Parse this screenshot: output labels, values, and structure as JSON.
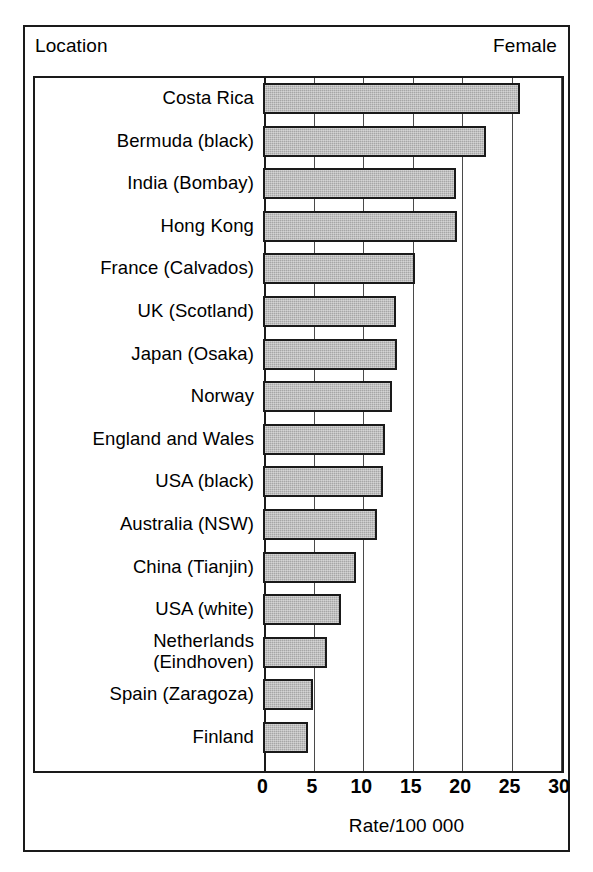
{
  "header": {
    "left_label": "Location",
    "right_label": "Female"
  },
  "axis": {
    "title": "Rate/100 000",
    "ticks": [
      "0",
      "5",
      "10",
      "15",
      "20",
      "25",
      "30"
    ]
  },
  "colors": {
    "bar_fill": "#a6a6a6",
    "bar_stroke": "#1a1a1a",
    "frame": "#1a1a1a",
    "gridline": "#4a4a4a",
    "background": "#ffffff"
  },
  "chart_data": {
    "type": "bar",
    "orientation": "horizontal",
    "title": "",
    "subtitle": "",
    "xlabel": "Rate/100 000",
    "ylabel": "Location",
    "legend": "Female",
    "legend_position": "top-right",
    "grid": true,
    "xlim": [
      0,
      30
    ],
    "xticks": [
      0,
      5,
      10,
      15,
      20,
      25,
      30
    ],
    "categories": [
      "Costa Rica",
      "Bermuda (black)",
      "India (Bombay)",
      "Hong Kong",
      "France (Calvados)",
      "UK (Scotland)",
      "Japan (Osaka)",
      "Norway",
      "England and Wales",
      "USA (black)",
      "Australia (NSW)",
      "China (Tianjin)",
      "USA (white)",
      "Netherlands\n(Eindhoven)",
      "Spain (Zaragoza)",
      "Finland"
    ],
    "values": [
      25.8,
      22.4,
      19.3,
      19.4,
      15.2,
      13.3,
      13.4,
      12.8,
      12.1,
      11.9,
      11.3,
      9.2,
      7.7,
      6.3,
      4.9,
      4.4
    ]
  }
}
